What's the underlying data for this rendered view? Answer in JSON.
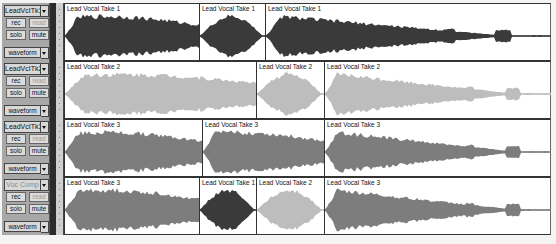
{
  "colors": {
    "take1": "#3a3a3a",
    "take2": "#bdbdbd",
    "take3": "#7d7d7d"
  },
  "tracks": [
    {
      "name": "LeadVcITk1",
      "name_dim": false,
      "rec_label": "rec",
      "read_label": "read",
      "solo_label": "solo",
      "mute_label": "mute",
      "view_label": "waveform",
      "clips": [
        {
          "label": "Lead Vocal Take 1",
          "take": 1,
          "x": 0,
          "w": 135
        },
        {
          "label": "Lead Vocal Take 1",
          "take": 1,
          "x": 135,
          "w": 66
        },
        {
          "label": "Lead Vocal Take 1",
          "take": 1,
          "x": 201,
          "w": 286
        }
      ]
    },
    {
      "name": "LeadVcITk2",
      "name_dim": false,
      "rec_label": "rec",
      "read_label": "read",
      "solo_label": "solo",
      "mute_label": "mute",
      "view_label": "waveform",
      "clips": [
        {
          "label": "Lead Vocal Take 2",
          "take": 2,
          "x": 0,
          "w": 192
        },
        {
          "label": "Lead Vocal Take 2",
          "take": 2,
          "x": 192,
          "w": 68
        },
        {
          "label": "Lead Vocal Take 2",
          "take": 2,
          "x": 260,
          "w": 227
        }
      ]
    },
    {
      "name": "LeadVcITk3",
      "name_dim": false,
      "rec_label": "rec",
      "read_label": "read",
      "solo_label": "solo",
      "mute_label": "mute",
      "view_label": "waveform",
      "clips": [
        {
          "label": "Lead Vocal Take 3",
          "take": 3,
          "x": 0,
          "w": 138
        },
        {
          "label": "Lead Vocal Take 3",
          "take": 3,
          "x": 138,
          "w": 122
        },
        {
          "label": "Lead Vocal Take 3",
          "take": 3,
          "x": 260,
          "w": 227
        }
      ]
    },
    {
      "name": "Voc Comp",
      "name_dim": true,
      "rec_label": "rec",
      "read_label": "read",
      "solo_label": "solo",
      "mute_label": "mute",
      "view_label": "waveform",
      "clips": [
        {
          "label": "Lead Vocal Take 3",
          "take": 3,
          "x": 0,
          "w": 135
        },
        {
          "label": "Lead Vocal Take 1",
          "take": 1,
          "x": 135,
          "w": 57
        },
        {
          "label": "Lead Vocal Take 2",
          "take": 2,
          "x": 192,
          "w": 68
        },
        {
          "label": "Lead Vocal Take 3",
          "take": 3,
          "x": 260,
          "w": 227
        }
      ]
    }
  ]
}
